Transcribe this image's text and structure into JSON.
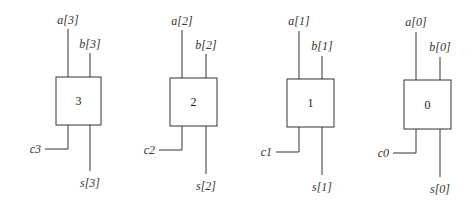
{
  "diagram": {
    "blocks": [
      {
        "id": "3",
        "label": "3",
        "a": "a[3]",
        "b": "b[3]",
        "c": "c3",
        "s": "s[3]",
        "x": 56,
        "y": 77
      },
      {
        "id": "2",
        "label": "2",
        "a": "a[2]",
        "b": "b[2]",
        "c": "c2",
        "s": "s[2]",
        "x": 170,
        "y": 78
      },
      {
        "id": "1",
        "label": "1",
        "a": "a[1]",
        "b": "b[1]",
        "c": "c1",
        "s": "s[1]",
        "x": 287,
        "y": 79
      },
      {
        "id": "0",
        "label": "0",
        "a": "a[0]",
        "b": "b[0]",
        "c": "c0",
        "s": "s[0]",
        "x": 404,
        "y": 80
      }
    ]
  }
}
